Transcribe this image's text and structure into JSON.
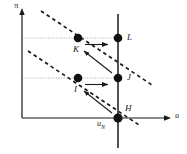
{
  "figure": {
    "title": "",
    "axes": {
      "y_label": "π",
      "x_label": "u",
      "origin": {
        "x": 22,
        "y": 118
      },
      "x_axis_end": {
        "x": 172,
        "y": 118
      },
      "y_axis_top": {
        "x": 22,
        "y": 12
      }
    },
    "vertical_line": {
      "name": "natural-rate-line",
      "x": 118,
      "y_top": 14,
      "y_bottom": 148,
      "label": "u",
      "label_sub": "N"
    },
    "points": [
      {
        "id": "L",
        "label": "L",
        "x": 118,
        "y": 38,
        "label_dx": 9,
        "label_dy": -1
      },
      {
        "id": "K",
        "label": "K",
        "x": 78,
        "y": 38,
        "label_dx": -3,
        "label_dy": 13
      },
      {
        "id": "J",
        "label": "J",
        "x": 118,
        "y": 78,
        "label_dx": 9,
        "label_dy": -1
      },
      {
        "id": "I",
        "label": "I",
        "x": 78,
        "y": 78,
        "label_dx": -3,
        "label_dy": 13
      },
      {
        "id": "H",
        "label": "H",
        "x": 118,
        "y": 118,
        "label_dx": 8,
        "label_dy": -8
      }
    ],
    "guide_lines": [
      {
        "name": "guide-line-upper",
        "x1": 22,
        "y1": 38,
        "x2": 118,
        "y2": 38
      },
      {
        "name": "guide-line-lower",
        "x1": 22,
        "y1": 78,
        "x2": 118,
        "y2": 78
      }
    ],
    "dashed_curves": [
      {
        "name": "short-run-phillips-curve-upper",
        "x1": 41,
        "y1": 11,
        "x2": 152,
        "y2": 85
      },
      {
        "name": "short-run-phillips-curve-lower",
        "x1": 28,
        "y1": 51,
        "x2": 139,
        "y2": 125
      }
    ],
    "arrows": [
      {
        "name": "arrow-K-to-L",
        "x1": 85,
        "y1": 44,
        "x2": 110,
        "y2": 44
      },
      {
        "name": "arrow-I-to-J",
        "x1": 85,
        "y1": 84,
        "x2": 110,
        "y2": 84
      },
      {
        "name": "arrow-J-to-K",
        "x1": 111,
        "y1": 72,
        "x2": 82,
        "y2": 49
      },
      {
        "name": "arrow-H-to-I",
        "x1": 111,
        "y1": 112,
        "x2": 82,
        "y2": 89
      }
    ],
    "styles": {
      "stroke": "#1a1a1a",
      "dot_fill": "#111111",
      "dot_radius": 4.2,
      "guide_color": "#b7b7b7",
      "axis_width": 1.1,
      "dash_width": 1.6
    }
  }
}
